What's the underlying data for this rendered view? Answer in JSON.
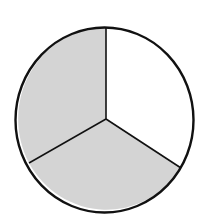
{
  "diagram": {
    "type": "fraction-circle",
    "total_parts": 3,
    "shaded_parts": 2,
    "colors": {
      "shaded": "#d4d4d4",
      "unshaded": "#ffffff",
      "outline": "#111111"
    },
    "segments": [
      {
        "name": "top-right",
        "shaded": false
      },
      {
        "name": "bottom",
        "shaded": true
      },
      {
        "name": "top-left",
        "shaded": true
      }
    ]
  }
}
